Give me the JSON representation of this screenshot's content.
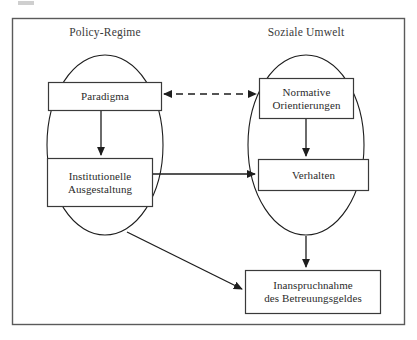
{
  "figure": {
    "kind": "conceptual-flow-diagram",
    "frame": {
      "stroke": "#5a5a5a",
      "fill": "#ffffff"
    },
    "ink": "#2b2b2b"
  },
  "groups": [
    {
      "id": "policy-regime",
      "label": "Policy-Regime"
    },
    {
      "id": "soziale-umwelt",
      "label": "Soziale Umwelt"
    }
  ],
  "nodes": [
    {
      "id": "paradigma",
      "label": "Paradigma"
    },
    {
      "id": "normative-orientierungen",
      "line1": "Normative",
      "line2": "Orientierungen"
    },
    {
      "id": "institutionelle-ausgestaltung",
      "line1": "Institutionelle",
      "line2": "Ausgestaltung"
    },
    {
      "id": "verhalten",
      "label": "Verhalten"
    },
    {
      "id": "inanspruchnahme",
      "line1": "Inanspruchnahme",
      "line2": "des Betreuungsgeldes"
    }
  ],
  "edges": [
    {
      "id": "paradigma-normative",
      "from": "paradigma",
      "to": "normative-orientierungen",
      "style": "dashed",
      "heads": "both"
    },
    {
      "id": "paradigma-institutionelle",
      "from": "paradigma",
      "to": "institutionelle-ausgestaltung",
      "style": "solid",
      "heads": "end"
    },
    {
      "id": "normative-verhalten",
      "from": "normative-orientierungen",
      "to": "verhalten",
      "style": "solid",
      "heads": "end"
    },
    {
      "id": "institutionelle-verhalten",
      "from": "institutionelle-ausgestaltung",
      "to": "verhalten",
      "style": "solid",
      "heads": "end"
    },
    {
      "id": "policyregime-inanspruchnahme",
      "from": "policy-regime",
      "to": "inanspruchnahme",
      "style": "solid",
      "heads": "end"
    },
    {
      "id": "sozialeumwelt-inanspruchnahme",
      "from": "soziale-umwelt",
      "to": "inanspruchnahme",
      "style": "solid",
      "heads": "end"
    }
  ]
}
